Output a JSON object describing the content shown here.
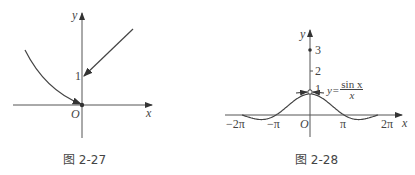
{
  "figures": [
    {
      "caption": "图 2-27",
      "labels": {
        "y": "y",
        "x": "x",
        "origin": "O",
        "one": "1"
      }
    },
    {
      "caption": "图 2-28",
      "labels": {
        "y": "y",
        "x": "x",
        "origin": "O",
        "one": "1",
        "two": "2",
        "three": "3",
        "neg2pi": "−2π",
        "negpi": "−π",
        "pi": "π",
        "twopi": "2π",
        "func_lhs": "y=",
        "func_num": "sin x",
        "func_den": "x"
      }
    }
  ],
  "chart_data": [
    {
      "type": "line",
      "title": "图 2-27",
      "xlabel": "x",
      "ylabel": "y",
      "series": [
        {
          "name": "left curve (x<0) approaching (0,0)",
          "points": [
            [
              -2.6,
              2.5
            ],
            [
              -1.5,
              1.2
            ],
            [
              -0.6,
              0.4
            ],
            [
              0,
              0
            ]
          ]
        },
        {
          "name": "right line (x>0) approaching (0,1)",
          "points": [
            [
              2.3,
              3.5
            ],
            [
              0,
              1
            ]
          ]
        }
      ],
      "annotations": [
        "point (0,0) filled",
        "y tick 1"
      ]
    },
    {
      "type": "line",
      "title": "图 2-28",
      "xlabel": "x",
      "ylabel": "y",
      "function": "y = sin x / x",
      "x_ticks": [
        "−2π",
        "−π",
        "O",
        "π",
        "2π"
      ],
      "y_ticks": [
        1,
        2,
        3
      ],
      "xlim": [
        -6.2832,
        6.2832
      ],
      "annotations": [
        "hollow point at (0,1)",
        "filled point at (0,3)"
      ]
    }
  ]
}
